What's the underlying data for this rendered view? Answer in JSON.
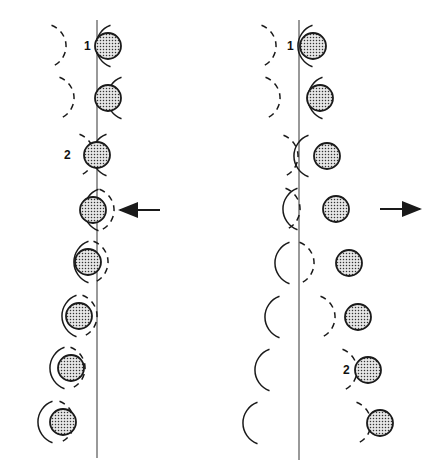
{
  "figure": {
    "panels": [
      {
        "id": "left",
        "direction_arrow": "left",
        "line_x": 97,
        "line_y": [
          20,
          458
        ],
        "arrow": {
          "x1": 160,
          "x2": 120,
          "y": 210
        },
        "rows": [
          {
            "ball": [
              108,
              46
            ],
            "solid_arc": [
              96,
              46,
              22
            ],
            "dashed_arc": [
              44,
              46,
              22
            ],
            "label": "1",
            "label_pos": [
              84,
              50
            ]
          },
          {
            "ball": [
              108,
              98
            ],
            "solid_arc": [
              107,
              98,
              22
            ],
            "dashed_arc": [
              52,
              98,
              22
            ]
          },
          {
            "ball": [
              97,
              155
            ],
            "solid_arc": [
              92,
              155,
              22
            ],
            "dashed_arc": [
              72,
              155,
              22
            ],
            "label": "2",
            "label_pos": [
              64,
              159
            ]
          },
          {
            "ball": [
              93,
              210
            ],
            "solid_arc": [
              84,
              210,
              22
            ],
            "dashed_arc": [
              92,
              210,
              22
            ]
          },
          {
            "ball": [
              88,
              262
            ],
            "solid_arc": [
              74,
              262,
              22
            ],
            "dashed_arc": [
              86,
              262,
              22
            ]
          },
          {
            "ball": [
              79,
              316
            ],
            "solid_arc": [
              62,
              316,
              22
            ],
            "dashed_arc": [
              75,
              316,
              22
            ]
          },
          {
            "ball": [
              71,
              368
            ],
            "solid_arc": [
              50,
              368,
              22
            ],
            "dashed_arc": [
              63,
              368,
              22
            ]
          },
          {
            "ball": [
              63,
              422
            ],
            "solid_arc": [
              38,
              422,
              22
            ],
            "dashed_arc": [
              52,
              422,
              22
            ]
          }
        ]
      },
      {
        "id": "right",
        "direction_arrow": "right",
        "line_x": 299,
        "line_y": [
          20,
          460
        ],
        "arrow": {
          "x1": 380,
          "x2": 420,
          "y": 209
        },
        "rows": [
          {
            "ball": [
              313,
              46
            ],
            "solid_arc": [
              298,
              46,
              22
            ],
            "dashed_arc": [
              254,
              46,
              22
            ],
            "label": "1",
            "label_pos": [
              287,
              50
            ]
          },
          {
            "ball": [
              320,
              98
            ],
            "solid_arc": [
              308,
              98,
              22
            ],
            "dashed_arc": [
              258,
              98,
              22
            ]
          },
          {
            "ball": [
              327,
              156
            ],
            "solid_arc": [
              294,
              156,
              22
            ],
            "dashed_arc": [
              276,
              156,
              22
            ]
          },
          {
            "ball": [
              336,
              209
            ],
            "solid_arc": [
              283,
              209,
              22
            ],
            "dashed_arc": [
              278,
              209,
              22
            ]
          },
          {
            "ball": [
              349,
              263
            ],
            "solid_arc": [
              275,
              263,
              22
            ],
            "dashed_arc": [
              292,
              263,
              22
            ]
          },
          {
            "ball": [
              358,
              317
            ],
            "solid_arc": [
              265,
              317,
              22
            ],
            "dashed_arc": [
              313,
              317,
              22
            ]
          },
          {
            "ball": [
              368,
              370
            ],
            "solid_arc": [
              255,
              370,
              22
            ],
            "dashed_arc": [
              335,
              370,
              22
            ],
            "label": "2",
            "label_pos": [
              343,
              374
            ]
          },
          {
            "ball": [
              380,
              423
            ],
            "solid_arc": [
              243,
              423,
              22
            ],
            "dashed_arc": [
              349,
              423,
              22
            ]
          }
        ]
      }
    ],
    "ball_radius": 13,
    "colors": {
      "stroke": "#1a1a1a",
      "ball_fill": "#e6e6e6",
      "dot": "#333333",
      "line": "#555555"
    }
  }
}
